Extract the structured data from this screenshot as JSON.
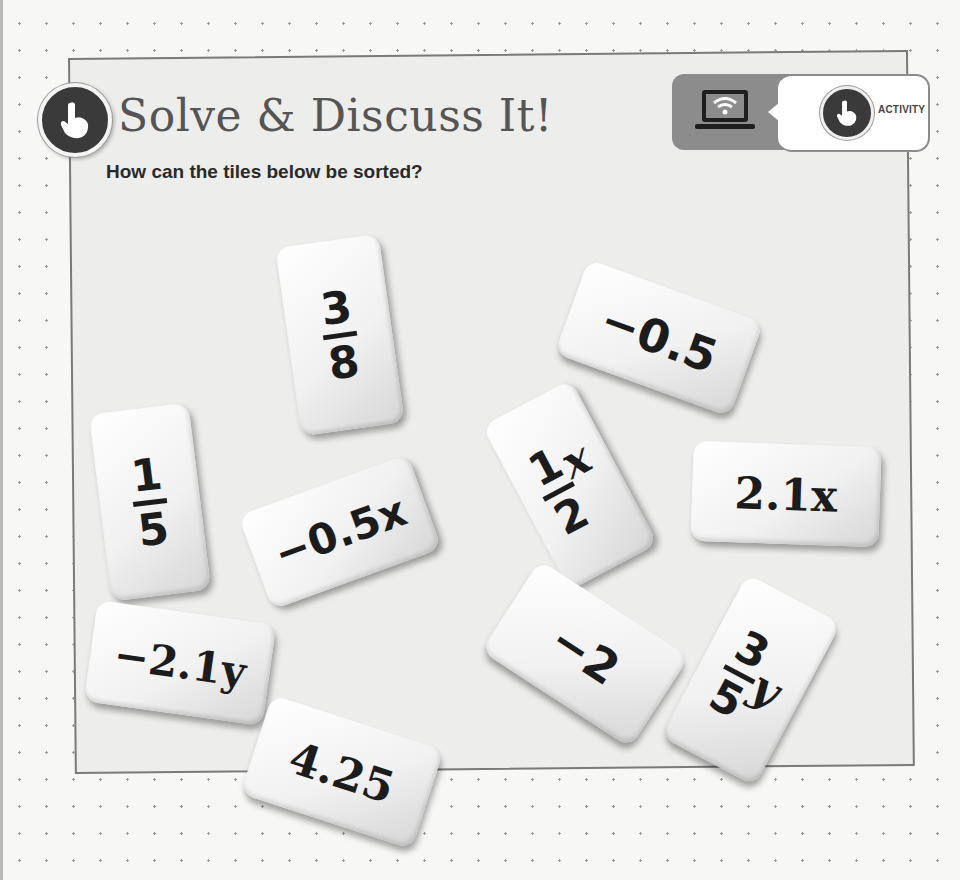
{
  "header": {
    "title": "Solve & Discuss It!",
    "title_icon": "pointing-hand-icon",
    "badge": {
      "device_icon": "laptop-wifi-icon",
      "activity_icon": "pointing-hand-icon",
      "label": "ACTIVITY"
    }
  },
  "prompt": "How can the tiles below be sorted?",
  "tiles": [
    {
      "id": "three-eighths",
      "num": "3",
      "den": "8",
      "text": "3/8"
    },
    {
      "id": "minus-half",
      "text": "−0.5"
    },
    {
      "id": "one-fifth",
      "num": "1",
      "den": "5",
      "text": "1/5"
    },
    {
      "id": "minus-half-x",
      "text": "−0.5x"
    },
    {
      "id": "half-x",
      "num": "1",
      "den": "2",
      "var": "x",
      "text": "1/2 x"
    },
    {
      "id": "two-point-one-x",
      "text": "2.1x"
    },
    {
      "id": "minus-two-point-one-y",
      "text": "−2.1y"
    },
    {
      "id": "minus-two",
      "text": "−2"
    },
    {
      "id": "three-fifths-y",
      "num": "3",
      "den": "5",
      "var": "y",
      "text": "3/5 y"
    },
    {
      "id": "four-point-two-five",
      "text": "4.25"
    }
  ],
  "colors": {
    "page_bg": "#f7f7f5",
    "box_bg": "#ededeb",
    "box_border": "#7a7a7a",
    "icon_dark": "#3a3a3a",
    "badge_grey": "#8c8c8c",
    "text_dark": "#1c1c1c"
  }
}
